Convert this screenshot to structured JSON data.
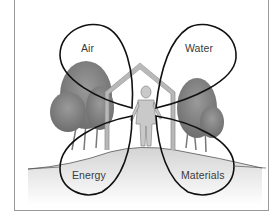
{
  "diagram": {
    "type": "four-petal diagram of a building and its resource flows",
    "center": "human figure inside a house outline, with trees on both sides and a hill ground line",
    "petals": [
      {
        "label": "Air",
        "position": "top-left"
      },
      {
        "label": "Water",
        "position": "top-right"
      },
      {
        "label": "Energy",
        "position": "bottom-left"
      },
      {
        "label": "Materials",
        "position": "bottom-right"
      }
    ],
    "colors": {
      "petal_stroke": "#111111",
      "house": "#b8b8b8",
      "trees": "#7d7d7d",
      "ground": "#d6d6d6",
      "frame": "#9a9a9a",
      "label_text": "#3a3a3a"
    }
  }
}
